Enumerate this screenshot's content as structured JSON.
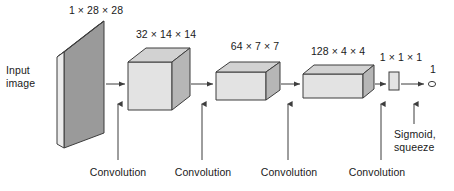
{
  "figure": {
    "type": "cnn-architecture-diagram",
    "colors": {
      "stroke": "#3d3d3d",
      "text": "#1a1a1a",
      "input_front": "#9a9a9a",
      "input_top": "#d8d8d8",
      "input_side": "#e8e8e8",
      "box_front": "#e3e3e3",
      "box_top": "#d2d2d2",
      "box_side": "#b6b6b6",
      "background": "#ffffff"
    },
    "input_label": {
      "line1": "Input",
      "line2": "image"
    },
    "layers": [
      {
        "name": "input-image-plane",
        "shape_label": "1 × 28 × 28"
      },
      {
        "name": "feature-map-1",
        "shape_label": "32 × 14 × 14"
      },
      {
        "name": "feature-map-2",
        "shape_label": "64 × 7 × 7"
      },
      {
        "name": "feature-map-3",
        "shape_label": "128 × 4 × 4"
      },
      {
        "name": "feature-map-4",
        "shape_label": "1 × 1 × 1"
      }
    ],
    "operations": [
      {
        "name": "convolution-1",
        "label": "Convolution"
      },
      {
        "name": "convolution-2",
        "label": "Convolution"
      },
      {
        "name": "convolution-3",
        "label": "Convolution"
      },
      {
        "name": "convolution-4",
        "label": "Convolution"
      }
    ],
    "final_operation": {
      "line1": "Sigmoid,",
      "line2": "squeeze"
    },
    "output": {
      "value_label": "1",
      "node": "output-neuron"
    }
  }
}
